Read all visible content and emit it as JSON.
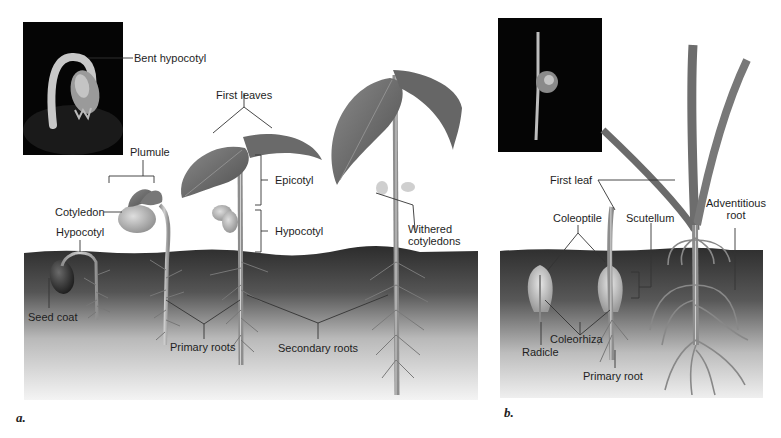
{
  "figure": {
    "panels": [
      {
        "letter": "a.",
        "subject": "Eudicot (bean) seedling development",
        "photo_label": "Bent hypocotyl",
        "labels": {
          "bent_hypocotyl": "Bent hypocotyl",
          "plumule": "Plumule",
          "cotyledon": "Cotyledon",
          "hypocotyl_early": "Hypocotyl",
          "seed_coat": "Seed coat",
          "first_leaves": "First leaves",
          "epicotyl": "Epicotyl",
          "hypocotyl": "Hypocotyl",
          "primary_roots": "Primary roots",
          "secondary_roots": "Secondary roots",
          "withered_cotyledons_1": "Withered",
          "withered_cotyledons_2": "cotyledons"
        }
      },
      {
        "letter": "b.",
        "subject": "Monocot (corn) seedling development",
        "labels": {
          "first_leaf": "First leaf",
          "coleoptile": "Coleoptile",
          "scutellum": "Scutellum",
          "adventitious_root_1": "Adventitious",
          "adventitious_root_2": "root",
          "radicle": "Radicle",
          "coleorhiza": "Coleorhiza",
          "primary_root": "Primary root"
        }
      }
    ],
    "colors": {
      "soil_top": "#2a2a2a",
      "soil_bottom": "#f2f2f2",
      "leaf": "#6a6a6a",
      "stem": "#b8b8b8",
      "photo_bg": "#050505",
      "leader_line": "#333333"
    }
  }
}
